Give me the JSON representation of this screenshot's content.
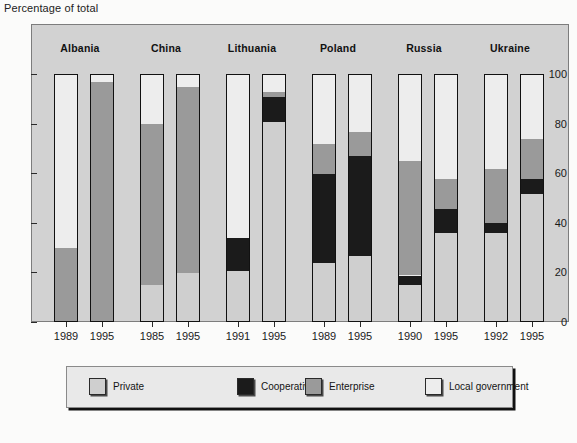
{
  "axis_title": "Percentage of total",
  "chart_data": {
    "type": "bar",
    "subtype": "stacked-column-100",
    "title": "",
    "xlabel": "",
    "ylabel": "Percentage of total",
    "ylim": [
      0,
      100
    ],
    "yticks": [
      0,
      20,
      40,
      60,
      80,
      100
    ],
    "ytick_labels": [
      "0",
      "20",
      "40",
      "60",
      "80",
      "100"
    ],
    "grid": false,
    "legend_position": "bottom",
    "groups": [
      "Albania",
      "China",
      "Lithuania",
      "Poland",
      "Russia",
      "Ukraine"
    ],
    "categories": [
      "1989",
      "1995",
      "1985",
      "1995",
      "1991",
      "1995",
      "1989",
      "1995",
      "1990",
      "1995",
      "1992",
      "1995"
    ],
    "series": [
      {
        "name": "Private",
        "color": "#cfcfcf",
        "values": [
          0,
          0,
          15,
          20,
          21,
          81,
          24,
          27,
          15,
          36,
          36,
          52
        ]
      },
      {
        "name": "Cooperative",
        "color": "#1b1b1b",
        "values": [
          0,
          0,
          0,
          0,
          13,
          10,
          36,
          40,
          4,
          10,
          4,
          6
        ]
      },
      {
        "name": "Enterprise",
        "color": "#9a9a9a",
        "values": [
          30,
          97,
          65,
          75,
          0,
          2,
          12,
          10,
          46,
          12,
          22,
          16
        ]
      },
      {
        "name": "Local government",
        "color": "#ededed",
        "values": [
          70,
          3,
          20,
          5,
          66,
          7,
          28,
          23,
          35,
          42,
          38,
          26
        ]
      }
    ],
    "bars": [
      {
        "group": "Albania",
        "year": "1989",
        "private": 0,
        "cooperative": 0,
        "enterprise": 30,
        "local_government": 70
      },
      {
        "group": "Albania",
        "year": "1995",
        "private": 0,
        "cooperative": 0,
        "enterprise": 97,
        "local_government": 3
      },
      {
        "group": "China",
        "year": "1985",
        "private": 15,
        "cooperative": 0,
        "enterprise": 65,
        "local_government": 20
      },
      {
        "group": "China",
        "year": "1995",
        "private": 20,
        "cooperative": 0,
        "enterprise": 75,
        "local_government": 5
      },
      {
        "group": "Lithuania",
        "year": "1991",
        "private": 21,
        "cooperative": 13,
        "enterprise": 0,
        "local_government": 66
      },
      {
        "group": "Lithuania",
        "year": "1995",
        "private": 81,
        "cooperative": 10,
        "enterprise": 2,
        "local_government": 7
      },
      {
        "group": "Poland",
        "year": "1989",
        "private": 24,
        "cooperative": 36,
        "enterprise": 12,
        "local_government": 28
      },
      {
        "group": "Poland",
        "year": "1995",
        "private": 27,
        "cooperative": 40,
        "enterprise": 10,
        "local_government": 23
      },
      {
        "group": "Russia",
        "year": "1990",
        "private": 15,
        "cooperative": 4,
        "enterprise": 46,
        "local_government": 35
      },
      {
        "group": "Russia",
        "year": "1995",
        "private": 36,
        "cooperative": 10,
        "enterprise": 12,
        "local_government": 42
      },
      {
        "group": "Ukraine",
        "year": "1992",
        "private": 36,
        "cooperative": 4,
        "enterprise": 22,
        "local_government": 38
      },
      {
        "group": "Ukraine",
        "year": "1995",
        "private": 52,
        "cooperative": 6,
        "enterprise": 16,
        "local_government": 26
      }
    ]
  },
  "legend": {
    "items": [
      {
        "label": "Private",
        "color": "#cfcfcf"
      },
      {
        "label": "Cooperative",
        "color": "#1b1b1b"
      },
      {
        "label": "Enterprise",
        "color": "#9a9a9a"
      },
      {
        "label": "Local government",
        "color": "#ededed"
      }
    ]
  },
  "colors": {
    "private": "#cfcfcf",
    "cooperative": "#1b1b1b",
    "enterprise": "#9a9a9a",
    "local_government": "#ededed",
    "plot_background": "#d2d2d2",
    "page_background": "#fbfbfa",
    "bar_outline": "#111111"
  }
}
